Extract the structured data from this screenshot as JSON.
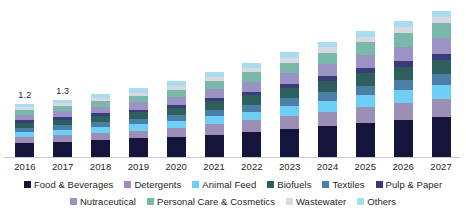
{
  "chart_data": {
    "type": "bar",
    "title": "",
    "subtitle": "",
    "xlabel": "",
    "ylabel": "",
    "stacked": true,
    "grid": false,
    "legend_position": "bottom",
    "ylim": [
      0,
      3.4
    ],
    "categories": [
      "2016",
      "2017",
      "2018",
      "2019",
      "2020",
      "2021",
      "2022",
      "2023",
      "2024",
      "2025",
      "2026",
      "2027"
    ],
    "data_labels": [
      {
        "category": "2016",
        "text": "1.2"
      },
      {
        "category": "2017",
        "text": "1.3"
      }
    ],
    "totals": [
      1.2,
      1.3,
      1.42,
      1.56,
      1.72,
      1.92,
      2.14,
      2.38,
      2.62,
      2.86,
      3.08,
      3.32
    ],
    "series": [
      {
        "name": "Food & Beverages",
        "color": "#14143c",
        "values": [
          0.32,
          0.35,
          0.38,
          0.42,
          0.46,
          0.51,
          0.57,
          0.64,
          0.71,
          0.78,
          0.84,
          0.9
        ]
      },
      {
        "name": "Detergents",
        "color": "#9b8fb5",
        "values": [
          0.14,
          0.15,
          0.17,
          0.18,
          0.2,
          0.23,
          0.26,
          0.29,
          0.32,
          0.35,
          0.38,
          0.41
        ]
      },
      {
        "name": "Animal Feed",
        "color": "#6ecff6",
        "values": [
          0.11,
          0.12,
          0.13,
          0.14,
          0.16,
          0.18,
          0.2,
          0.22,
          0.25,
          0.27,
          0.29,
          0.32
        ]
      },
      {
        "name": "Textiles",
        "color": "#4a7fa8",
        "values": [
          0.09,
          0.1,
          0.11,
          0.12,
          0.13,
          0.15,
          0.16,
          0.18,
          0.2,
          0.22,
          0.24,
          0.26
        ]
      },
      {
        "name": "Biofuels",
        "color": "#2d5f5d",
        "values": [
          0.12,
          0.13,
          0.14,
          0.15,
          0.17,
          0.19,
          0.21,
          0.23,
          0.25,
          0.28,
          0.3,
          0.32
        ]
      },
      {
        "name": "Pulp & Paper",
        "color": "#3a3a7c",
        "values": [
          0.05,
          0.05,
          0.06,
          0.06,
          0.07,
          0.08,
          0.08,
          0.09,
          0.1,
          0.11,
          0.12,
          0.13
        ]
      },
      {
        "name": "Nutraceutical",
        "color": "#9b93c4",
        "values": [
          0.13,
          0.14,
          0.15,
          0.17,
          0.18,
          0.2,
          0.23,
          0.25,
          0.28,
          0.3,
          0.33,
          0.35
        ]
      },
      {
        "name": "Personal Care & Cosmetics",
        "color": "#7ab8ab",
        "values": [
          0.11,
          0.12,
          0.13,
          0.15,
          0.16,
          0.18,
          0.21,
          0.24,
          0.26,
          0.29,
          0.31,
          0.34
        ]
      },
      {
        "name": "Wastewater",
        "color": "#d8d8e0",
        "values": [
          0.06,
          0.06,
          0.07,
          0.07,
          0.08,
          0.09,
          0.1,
          0.11,
          0.12,
          0.13,
          0.14,
          0.15
        ]
      },
      {
        "name": "Others",
        "color": "#a8dcf0",
        "values": [
          0.07,
          0.08,
          0.08,
          0.1,
          0.11,
          0.11,
          0.12,
          0.13,
          0.13,
          0.13,
          0.13,
          0.14
        ]
      }
    ]
  },
  "legend": {
    "row1": [
      {
        "label": "Food & Beverages",
        "color": "#14143c"
      },
      {
        "label": "Detergents",
        "color": "#9b8fb5"
      },
      {
        "label": "Animal Feed",
        "color": "#6ecff6"
      },
      {
        "label": "Biofuels",
        "color": "#2d5f5d"
      },
      {
        "label": "Textiles",
        "color": "#4a7fa8"
      },
      {
        "label": "Pulp & Paper",
        "color": "#3a3a7c"
      }
    ],
    "row2": [
      {
        "label": "Nutraceutical",
        "color": "#9b93c4"
      },
      {
        "label": "Personal Care & Cosmetics",
        "color": "#7ab8ab"
      },
      {
        "label": "Wastewater",
        "color": "#d8d8e0"
      },
      {
        "label": "Others",
        "color": "#a8dcf0"
      }
    ]
  },
  "axis": {
    "baseline_color": "#c9c9cf"
  }
}
